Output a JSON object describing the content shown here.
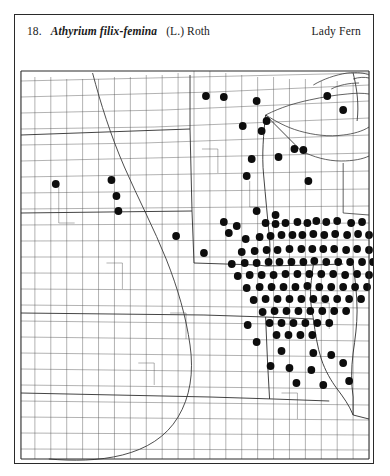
{
  "plate": {
    "number": "18.",
    "binomial": "Athyrium filix-femina",
    "authority": "(L.) Roth",
    "common_name": "Lady Fern"
  },
  "map": {
    "kind": "county-dot-distribution-map",
    "region": "Upper Midwest and Great Plains, United States",
    "dot_symbol": "filled-black-circle",
    "dot_meaning": "county record",
    "dot_radius_px": 3.9,
    "colors": {
      "dot": "#0d0d0d",
      "county_boundary": "#555555",
      "state_boundary": "#2f2f2f",
      "frame": "#2a2a2a",
      "background": "#ffffff"
    },
    "dot_count": 131,
    "dots": [
      [
        314,
        33
      ],
      [
        330,
        47
      ],
      [
        243,
        38
      ],
      [
        229,
        63
      ],
      [
        248,
        68
      ],
      [
        253,
        58
      ],
      [
        192,
        33
      ],
      [
        210,
        34
      ],
      [
        238,
        96
      ],
      [
        265,
        94
      ],
      [
        281,
        86
      ],
      [
        290,
        87
      ],
      [
        233,
        113
      ],
      [
        295,
        118
      ],
      [
        41,
        121
      ],
      [
        97,
        117
      ],
      [
        102,
        133
      ],
      [
        104,
        148
      ],
      [
        162,
        173
      ],
      [
        190,
        190
      ],
      [
        243,
        148
      ],
      [
        262,
        152
      ],
      [
        210,
        159
      ],
      [
        215,
        170
      ],
      [
        223,
        163
      ],
      [
        252,
        160
      ],
      [
        262,
        161
      ],
      [
        272,
        160
      ],
      [
        284,
        159
      ],
      [
        294,
        160
      ],
      [
        303,
        158
      ],
      [
        313,
        159
      ],
      [
        324,
        158
      ],
      [
        338,
        160
      ],
      [
        349,
        159
      ],
      [
        232,
        176
      ],
      [
        246,
        174
      ],
      [
        257,
        173
      ],
      [
        268,
        172
      ],
      [
        279,
        172
      ],
      [
        289,
        172
      ],
      [
        300,
        171
      ],
      [
        311,
        172
      ],
      [
        322,
        171
      ],
      [
        334,
        172
      ],
      [
        345,
        171
      ],
      [
        356,
        172
      ],
      [
        228,
        189
      ],
      [
        241,
        188
      ],
      [
        253,
        187
      ],
      [
        264,
        187
      ],
      [
        276,
        186
      ],
      [
        288,
        186
      ],
      [
        299,
        186
      ],
      [
        310,
        186
      ],
      [
        321,
        186
      ],
      [
        333,
        187
      ],
      [
        344,
        186
      ],
      [
        356,
        187
      ],
      [
        218,
        201
      ],
      [
        231,
        200
      ],
      [
        243,
        200
      ],
      [
        255,
        199
      ],
      [
        266,
        199
      ],
      [
        278,
        199
      ],
      [
        290,
        199
      ],
      [
        301,
        198
      ],
      [
        313,
        199
      ],
      [
        325,
        199
      ],
      [
        337,
        199
      ],
      [
        349,
        199
      ],
      [
        360,
        199
      ],
      [
        224,
        213
      ],
      [
        236,
        212
      ],
      [
        248,
        212
      ],
      [
        260,
        212
      ],
      [
        272,
        211
      ],
      [
        284,
        211
      ],
      [
        296,
        211
      ],
      [
        308,
        211
      ],
      [
        320,
        211
      ],
      [
        332,
        212
      ],
      [
        344,
        211
      ],
      [
        356,
        212
      ],
      [
        233,
        225
      ],
      [
        246,
        224
      ],
      [
        258,
        224
      ],
      [
        270,
        224
      ],
      [
        282,
        224
      ],
      [
        294,
        223
      ],
      [
        306,
        224
      ],
      [
        318,
        224
      ],
      [
        330,
        224
      ],
      [
        342,
        224
      ],
      [
        354,
        224
      ],
      [
        240,
        237
      ],
      [
        252,
        236
      ],
      [
        264,
        236
      ],
      [
        276,
        236
      ],
      [
        288,
        236
      ],
      [
        300,
        236
      ],
      [
        312,
        236
      ],
      [
        324,
        236
      ],
      [
        336,
        236
      ],
      [
        348,
        236
      ],
      [
        249,
        249
      ],
      [
        261,
        248
      ],
      [
        273,
        248
      ],
      [
        285,
        248
      ],
      [
        297,
        248
      ],
      [
        309,
        248
      ],
      [
        321,
        248
      ],
      [
        333,
        248
      ],
      [
        256,
        260
      ],
      [
        268,
        260
      ],
      [
        280,
        260
      ],
      [
        292,
        260
      ],
      [
        304,
        260
      ],
      [
        316,
        260
      ],
      [
        263,
        272
      ],
      [
        275,
        272
      ],
      [
        287,
        272
      ],
      [
        299,
        272
      ],
      [
        234,
        262
      ],
      [
        243,
        279
      ],
      [
        268,
        288
      ],
      [
        300,
        290
      ],
      [
        318,
        292
      ],
      [
        257,
        303
      ],
      [
        276,
        305
      ],
      [
        298,
        307
      ],
      [
        330,
        300
      ],
      [
        283,
        320
      ],
      [
        310,
        322
      ],
      [
        336,
        318
      ]
    ]
  }
}
